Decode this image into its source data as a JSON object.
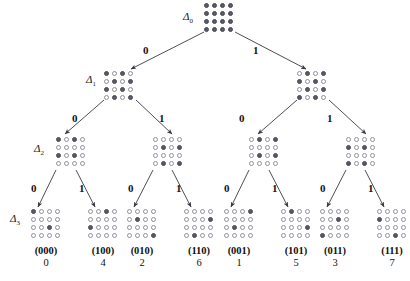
{
  "figure": {
    "type": "decimation-tree",
    "grid_size": 4,
    "levels": 4,
    "colors": {
      "dot_filled": "#5a5a66",
      "dot_empty": "#ffffff",
      "dot_stroke": "#8f8f99",
      "edge": "#3a3a44",
      "text": "#111111",
      "background": "#ffffff"
    }
  },
  "level_labels": [
    {
      "id": "d0",
      "text": "Δ0",
      "symbol": "Δ",
      "subscript": "0"
    },
    {
      "id": "d1",
      "text": "Δ1",
      "symbol": "Δ",
      "subscript": "1"
    },
    {
      "id": "d2",
      "text": "Δ2",
      "symbol": "Δ",
      "subscript": "2"
    },
    {
      "id": "d3",
      "text": "Δ3",
      "symbol": "Δ",
      "subscript": "3"
    }
  ],
  "edge_labels": {
    "zero": "0",
    "one": "1"
  },
  "nodes": {
    "root": {
      "name": "delta0-node",
      "level": 0,
      "pattern": [
        [
          1,
          1,
          1,
          1
        ],
        [
          1,
          1,
          1,
          1
        ],
        [
          1,
          1,
          1,
          1
        ],
        [
          1,
          1,
          1,
          1
        ]
      ]
    },
    "level1": [
      {
        "name": "delta1-node-left",
        "branch": "0",
        "pattern": [
          [
            1,
            0,
            1,
            0
          ],
          [
            0,
            1,
            0,
            1
          ],
          [
            1,
            0,
            1,
            0
          ],
          [
            0,
            1,
            0,
            1
          ]
        ]
      },
      {
        "name": "delta1-node-right",
        "branch": "1",
        "pattern": [
          [
            0,
            1,
            0,
            1
          ],
          [
            1,
            0,
            1,
            0
          ],
          [
            0,
            1,
            0,
            1
          ],
          [
            1,
            0,
            1,
            0
          ]
        ]
      }
    ],
    "level2": [
      {
        "name": "delta2-node-00",
        "branch": "00",
        "pattern": [
          [
            1,
            0,
            1,
            0
          ],
          [
            0,
            0,
            0,
            0
          ],
          [
            1,
            0,
            1,
            0
          ],
          [
            0,
            0,
            0,
            0
          ]
        ]
      },
      {
        "name": "delta2-node-10",
        "branch": "10",
        "pattern": [
          [
            0,
            0,
            0,
            0
          ],
          [
            0,
            1,
            0,
            1
          ],
          [
            0,
            0,
            0,
            0
          ],
          [
            0,
            1,
            0,
            1
          ]
        ]
      },
      {
        "name": "delta2-node-01",
        "branch": "01",
        "pattern": [
          [
            0,
            1,
            0,
            1
          ],
          [
            0,
            0,
            0,
            0
          ],
          [
            0,
            1,
            0,
            1
          ],
          [
            0,
            0,
            0,
            0
          ]
        ]
      },
      {
        "name": "delta2-node-11",
        "branch": "11",
        "pattern": [
          [
            0,
            0,
            0,
            0
          ],
          [
            1,
            0,
            1,
            0
          ],
          [
            0,
            0,
            0,
            0
          ],
          [
            1,
            0,
            1,
            0
          ]
        ]
      }
    ],
    "level3": [
      {
        "name": "delta3-leaf-000",
        "binary": "(000)",
        "decimal": "0",
        "pattern": [
          [
            1,
            0,
            0,
            0
          ],
          [
            0,
            0,
            0,
            0
          ],
          [
            0,
            0,
            1,
            0
          ],
          [
            0,
            0,
            0,
            0
          ]
        ]
      },
      {
        "name": "delta3-leaf-100",
        "binary": "(100)",
        "decimal": "4",
        "pattern": [
          [
            0,
            0,
            1,
            0
          ],
          [
            0,
            0,
            0,
            0
          ],
          [
            1,
            0,
            0,
            0
          ],
          [
            0,
            0,
            0,
            0
          ]
        ]
      },
      {
        "name": "delta3-leaf-010",
        "binary": "(010)",
        "decimal": "2",
        "pattern": [
          [
            0,
            0,
            0,
            0
          ],
          [
            0,
            1,
            0,
            0
          ],
          [
            0,
            0,
            0,
            0
          ],
          [
            0,
            0,
            0,
            1
          ]
        ]
      },
      {
        "name": "delta3-leaf-110",
        "binary": "(110)",
        "decimal": "6",
        "pattern": [
          [
            0,
            0,
            0,
            0
          ],
          [
            0,
            0,
            0,
            1
          ],
          [
            0,
            0,
            0,
            0
          ],
          [
            0,
            1,
            0,
            0
          ]
        ]
      },
      {
        "name": "delta3-leaf-001",
        "binary": "(001)",
        "decimal": "1",
        "pattern": [
          [
            0,
            0,
            0,
            1
          ],
          [
            0,
            0,
            0,
            0
          ],
          [
            0,
            1,
            0,
            0
          ],
          [
            0,
            0,
            0,
            0
          ]
        ]
      },
      {
        "name": "delta3-leaf-101",
        "binary": "(101)",
        "decimal": "5",
        "pattern": [
          [
            0,
            1,
            0,
            0
          ],
          [
            0,
            0,
            0,
            0
          ],
          [
            0,
            0,
            0,
            1
          ],
          [
            0,
            0,
            0,
            0
          ]
        ]
      },
      {
        "name": "delta3-leaf-011",
        "binary": "(011)",
        "decimal": "3",
        "pattern": [
          [
            0,
            0,
            0,
            0
          ],
          [
            0,
            0,
            1,
            0
          ],
          [
            0,
            0,
            0,
            0
          ],
          [
            1,
            0,
            0,
            0
          ]
        ]
      },
      {
        "name": "delta3-leaf-111",
        "binary": "(111)",
        "decimal": "7",
        "pattern": [
          [
            0,
            0,
            0,
            0
          ],
          [
            1,
            0,
            0,
            0
          ],
          [
            0,
            0,
            0,
            0
          ],
          [
            0,
            0,
            1,
            0
          ]
        ]
      }
    ]
  },
  "edges": [
    {
      "from": "root",
      "to": "delta1-node-left",
      "label": "0",
      "lx": 143,
      "ly": 44
    },
    {
      "from": "root",
      "to": "delta1-node-right",
      "label": "1",
      "lx": 253,
      "ly": 44
    },
    {
      "from": "delta1-node-left",
      "to": "delta2-node-00",
      "label": "0",
      "lx": 72,
      "ly": 112
    },
    {
      "from": "delta1-node-left",
      "to": "delta2-node-10",
      "label": "1",
      "lx": 159,
      "ly": 112
    },
    {
      "from": "delta1-node-right",
      "to": "delta2-node-01",
      "label": "0",
      "lx": 239,
      "ly": 112
    },
    {
      "from": "delta1-node-right",
      "to": "delta2-node-11",
      "label": "1",
      "lx": 327,
      "ly": 112
    },
    {
      "from": "delta2-node-00",
      "to": "delta3-leaf-000",
      "label": "0",
      "lx": 31,
      "ly": 182
    },
    {
      "from": "delta2-node-00",
      "to": "delta3-leaf-100",
      "label": "1",
      "lx": 79,
      "ly": 182
    },
    {
      "from": "delta2-node-10",
      "to": "delta3-leaf-010",
      "label": "0",
      "lx": 128,
      "ly": 182
    },
    {
      "from": "delta2-node-10",
      "to": "delta3-leaf-110",
      "label": "1",
      "lx": 176,
      "ly": 182
    },
    {
      "from": "delta2-node-01",
      "to": "delta3-leaf-001",
      "label": "0",
      "lx": 224,
      "ly": 182
    },
    {
      "from": "delta2-node-01",
      "to": "delta3-leaf-101",
      "label": "1",
      "lx": 272,
      "ly": 182
    },
    {
      "from": "delta2-node-11",
      "to": "delta3-leaf-011",
      "label": "0",
      "lx": 320,
      "ly": 182
    },
    {
      "from": "delta2-node-11",
      "to": "delta3-leaf-111",
      "label": "1",
      "lx": 368,
      "ly": 182
    }
  ]
}
